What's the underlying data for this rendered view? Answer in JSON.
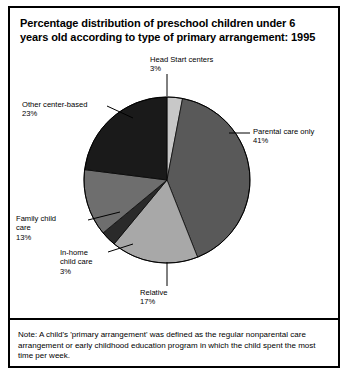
{
  "figure": {
    "title": "Percentage distribution of preschool children under 6 years old according to type of primary arrangement: 1995",
    "note": "Note: A child's 'primary arrangement' was defined as the regular nonparental care arrangement or early childhood education program in which the child spent the most time per week."
  },
  "chart_data": {
    "type": "pie",
    "title": "Percentage distribution of preschool children under 6 years old according to type of primary arrangement: 1995",
    "xlabel": "",
    "ylabel": "",
    "unit": "percent",
    "start_angle_deg": 0,
    "direction": "clockwise",
    "categories": [
      "Head Start centers",
      "Parental care only",
      "Relative",
      "In-home child care",
      "Family child care",
      "Other center-based"
    ],
    "values": [
      3,
      41,
      17,
      3,
      13,
      23
    ],
    "colors": [
      "#c8c8c8",
      "#595959",
      "#a8a8a8",
      "#2a2a2a",
      "#6e6e6e",
      "#1a1a1a"
    ],
    "slices": [
      {
        "label": "Head Start centers",
        "value": 3,
        "value_text": "3%",
        "color": "#c8c8c8"
      },
      {
        "label": "Parental care only",
        "value": 41,
        "value_text": "41%",
        "color": "#595959"
      },
      {
        "label": "Relative",
        "value": 17,
        "value_text": "17%",
        "color": "#a8a8a8"
      },
      {
        "label": "In-home child care",
        "value": 3,
        "value_text": "3%",
        "color": "#2a2a2a"
      },
      {
        "label": "Family child care",
        "value": 13,
        "value_text": "13%",
        "color": "#6e6e6e"
      },
      {
        "label": "Other center-based",
        "value": 23,
        "value_text": "23%",
        "color": "#1a1a1a"
      }
    ],
    "legend": "none",
    "grid": false
  },
  "labels": {
    "head_start": "Head Start centers\n3%",
    "other_center": "Other center-based\n23%",
    "parental": "Parental care only\n41%",
    "family": "Family child\ncare\n13%",
    "inhome": "In-home\nchild care\n3%",
    "relative": "Relative\n17%"
  }
}
